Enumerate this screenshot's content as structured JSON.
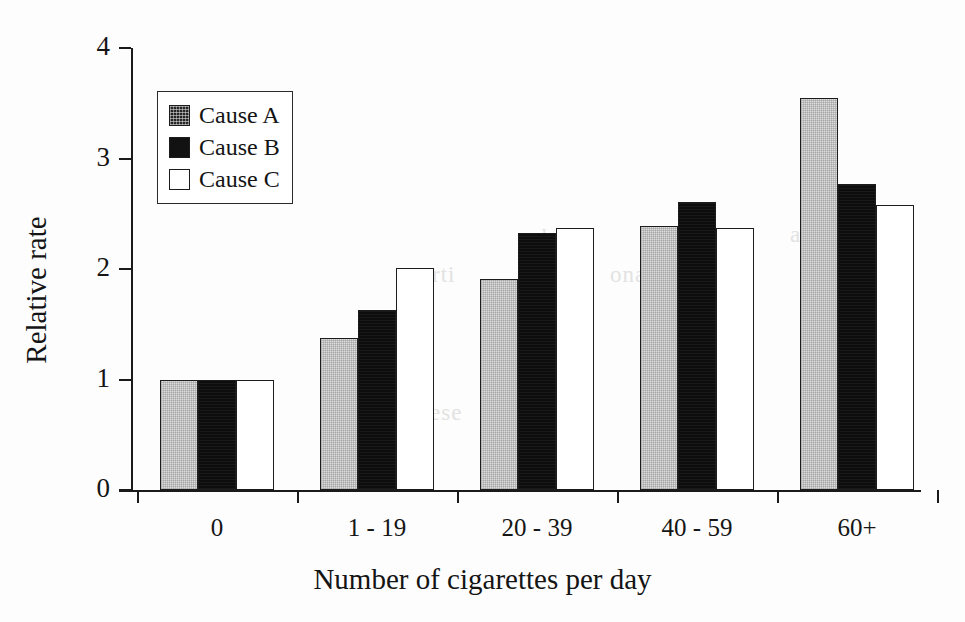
{
  "chart_data": {
    "type": "bar",
    "title": "",
    "xlabel": "Number of cigarettes per day",
    "ylabel": "Relative rate",
    "categories": [
      "0",
      "1 - 19",
      "20 - 39",
      "40 - 59",
      "60+"
    ],
    "series": [
      {
        "name": "Cause A",
        "color": "#dcdcdc",
        "values": [
          1.0,
          1.38,
          1.91,
          2.39,
          3.55
        ]
      },
      {
        "name": "Cause B",
        "color": "#0d0d0d",
        "values": [
          1.0,
          1.63,
          2.33,
          2.61,
          2.77
        ]
      },
      {
        "name": "Cause C",
        "color": "#ffffff",
        "values": [
          1.0,
          2.01,
          2.37,
          2.37,
          2.58
        ]
      }
    ],
    "ylim": [
      0,
      4
    ],
    "yticks": [
      0,
      1,
      2,
      3,
      4
    ],
    "ytick_labels": [
      "0",
      "1",
      "2",
      "3",
      "4"
    ],
    "grid": false,
    "legend_position": "upper left"
  },
  "legend": {
    "items": [
      {
        "label": "Cause A",
        "swatch": "filled-gray-square"
      },
      {
        "label": "Cause B",
        "swatch": "filled-black-square"
      },
      {
        "label": "Cause C",
        "swatch": "empty-white-square"
      }
    ]
  },
  "artifacts": {
    "bleed_text": [
      "cvb",
      "rti",
      "ona",
      "rd",
      "al",
      "cro",
      "dic",
      "ual",
      "ese",
      "ial"
    ]
  }
}
